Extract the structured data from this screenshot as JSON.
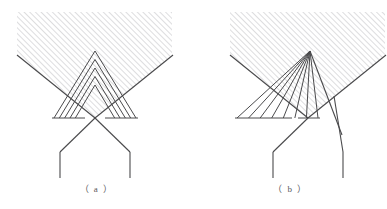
{
  "figure": {
    "background_color": "#ffffff",
    "line_color": "#4a4a4c",
    "hatch_color": "#c9c9cb",
    "caption_color": "#58585a",
    "width": 387,
    "height": 209
  },
  "panels": [
    {
      "id": "a",
      "caption": "（ a ）",
      "description": "Outer V with hatched wedge above and nested symmetric chevrons inside",
      "hatch": {
        "x": 17,
        "y": 12,
        "width": 155,
        "height": 106,
        "angle_deg": 45,
        "spacing": 4
      },
      "outer_v": {
        "left_top_x": 17,
        "left_top_y": 55,
        "apex_x": 95,
        "apex_y": 118,
        "right_top_x": 173,
        "right_top_y": 55
      },
      "baseline_y": 118,
      "nested_chevrons": 5,
      "chevron_apex_x": 95,
      "chevron_apex_top_y": 51,
      "chevron_half_spread": 41,
      "tails": {
        "apex_x": 95,
        "apex_y": 118,
        "left_bend_x": 60,
        "right_bend_x": 130,
        "bend_y": 152,
        "bottom_y": 178
      }
    },
    {
      "id": "b",
      "caption": "（ b ）",
      "description": "Outer V with hatched wedge above and an asymmetric fan of parallel rays from a single apex crossing the right arm",
      "hatch": {
        "x": 36,
        "y": 12,
        "width": 155,
        "height": 106,
        "angle_deg": 45,
        "spacing": 4
      },
      "outer_v": {
        "left_top_x": 36,
        "left_top_y": 55,
        "apex_x": 114,
        "apex_y": 118,
        "right_top_x": 192,
        "right_top_y": 55
      },
      "baseline_y": 118,
      "fan_rays": 8,
      "fan_origin_x": 116,
      "fan_origin_y": 51,
      "fan_base_start_x": 43,
      "fan_base_end_x": 124,
      "tails": {
        "apex_x": 114,
        "apex_y": 118,
        "left_bend_x": 79,
        "right_bend_x": 149,
        "bend_y": 152,
        "bottom_y": 178,
        "crossing": true
      }
    }
  ]
}
